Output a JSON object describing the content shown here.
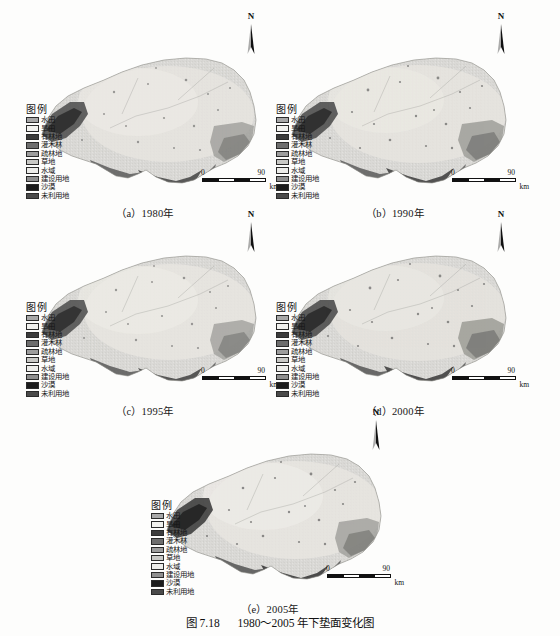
{
  "figure": {
    "caption_number": "图 7.18",
    "caption_text": "1980～2005 年下垫面变化图"
  },
  "legend": {
    "title": "图例",
    "items": [
      {
        "label": "水田",
        "color": "#a8a8a8"
      },
      {
        "label": "旱田",
        "color": "#f2f2ef"
      },
      {
        "label": "有林地",
        "color": "#3c3c3c"
      },
      {
        "label": "灌木林",
        "color": "#6e6e6e"
      },
      {
        "label": "疏林地",
        "color": "#9d9d9d"
      },
      {
        "label": "草地",
        "color": "#c9c9c6"
      },
      {
        "label": "水域",
        "color": "#ededea"
      },
      {
        "label": "建设用地",
        "color": "#8f8f8f"
      },
      {
        "label": "沙漠",
        "color": "#1c1c1c"
      },
      {
        "label": "未利用地",
        "color": "#4a4a4a"
      }
    ]
  },
  "north_arrow": {
    "label": "N"
  },
  "scale_bar": {
    "min": "0",
    "max": "90",
    "unit": "km"
  },
  "panels": [
    {
      "id": "a",
      "caption": "（a）1980年",
      "year": "1980"
    },
    {
      "id": "b",
      "caption": "（b）1990年",
      "year": "1990"
    },
    {
      "id": "c",
      "caption": "（c）1995年",
      "year": "1995"
    },
    {
      "id": "d",
      "caption": "（d）2000年",
      "year": "2000"
    },
    {
      "id": "e",
      "caption": "（e）2005年",
      "year": "2005"
    }
  ],
  "chart_data": {
    "type": "map",
    "title": "1980～2005 年下垫面变化图",
    "map_kind": "land-cover classification (thematic raster map)",
    "panel_count": 5,
    "years": [
      "1980",
      "1990",
      "1995",
      "2000",
      "2005"
    ],
    "classes": [
      "水田",
      "旱田",
      "有林地",
      "灌木林",
      "疏林地",
      "草地",
      "水域",
      "建设用地",
      "沙漠",
      "未利用地"
    ],
    "class_colors": [
      "#a8a8a8",
      "#f2f2ef",
      "#3c3c3c",
      "#6e6e6e",
      "#9d9d9d",
      "#c9c9c6",
      "#ededea",
      "#8f8f8f",
      "#1c1c1c",
      "#4a4a4a"
    ],
    "scale_min": 0,
    "scale_max": 90,
    "scale_unit": "km",
    "orientation": "N up",
    "colormap": "grayscale",
    "legend_position": "inside-left"
  }
}
